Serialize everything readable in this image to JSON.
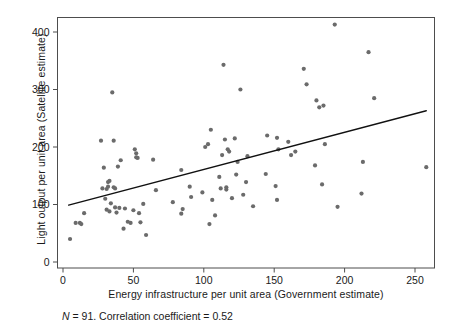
{
  "chart_data": {
    "type": "scatter",
    "title": "",
    "xlabel": "Energy infrastructure per unit area (Government estimate)",
    "ylabel": "Light output per unit area (Satellite estimate)",
    "caption_prefix": "N",
    "caption": " = 91. Correlation coefficient = 0.52",
    "n": 91,
    "correlation_coefficient": 0.52,
    "xlim": [
      -6,
      265
    ],
    "ylim": [
      -18,
      430
    ],
    "xticks": [
      0,
      50,
      100,
      150,
      200,
      250
    ],
    "yticks": [
      0,
      100,
      200,
      300,
      400
    ],
    "grid": false,
    "legend": "none",
    "marker_color": "#6b6b6b",
    "marker_size_px": 4.2,
    "line_color": "#111111",
    "axis_color": "#4d4d4d",
    "trendline": {
      "type": "linear-fit",
      "x_start": 4,
      "y_start": 99,
      "x_end": 258,
      "y_end": 263
    },
    "points": [
      [
        5,
        40
      ],
      [
        9,
        68
      ],
      [
        12,
        68
      ],
      [
        13,
        66
      ],
      [
        15,
        85
      ],
      [
        27,
        211
      ],
      [
        28,
        128
      ],
      [
        29,
        164
      ],
      [
        30,
        110
      ],
      [
        31,
        91
      ],
      [
        31,
        127
      ],
      [
        32,
        131
      ],
      [
        32,
        139
      ],
      [
        33,
        141
      ],
      [
        33,
        88
      ],
      [
        34,
        102
      ],
      [
        35,
        295
      ],
      [
        36,
        211
      ],
      [
        36,
        130
      ],
      [
        37,
        128
      ],
      [
        37,
        95
      ],
      [
        38,
        86
      ],
      [
        39,
        166
      ],
      [
        40,
        94
      ],
      [
        41,
        177
      ],
      [
        43,
        58
      ],
      [
        44,
        93
      ],
      [
        46,
        70
      ],
      [
        48,
        68
      ],
      [
        50,
        90
      ],
      [
        51,
        196
      ],
      [
        52,
        189
      ],
      [
        52,
        182
      ],
      [
        53,
        181
      ],
      [
        54,
        85
      ],
      [
        55,
        69
      ],
      [
        57,
        101
      ],
      [
        59,
        47
      ],
      [
        64,
        178
      ],
      [
        66,
        125
      ],
      [
        78,
        104
      ],
      [
        84,
        160
      ],
      [
        84,
        84
      ],
      [
        85,
        92
      ],
      [
        90,
        131
      ],
      [
        91,
        113
      ],
      [
        99,
        121
      ],
      [
        101,
        200
      ],
      [
        103,
        205
      ],
      [
        104,
        66
      ],
      [
        105,
        230
      ],
      [
        106,
        108
      ],
      [
        108,
        81
      ],
      [
        111,
        148
      ],
      [
        112,
        128
      ],
      [
        113,
        186
      ],
      [
        114,
        343
      ],
      [
        115,
        213
      ],
      [
        116,
        130
      ],
      [
        116,
        126
      ],
      [
        117,
        196
      ],
      [
        118,
        192
      ],
      [
        120,
        111
      ],
      [
        122,
        215
      ],
      [
        123,
        152
      ],
      [
        124,
        174
      ],
      [
        126,
        300
      ],
      [
        128,
        117
      ],
      [
        130,
        139
      ],
      [
        131,
        184
      ],
      [
        135,
        97
      ],
      [
        144,
        153
      ],
      [
        145,
        220
      ],
      [
        151,
        132
      ],
      [
        152,
        108
      ],
      [
        152,
        216
      ],
      [
        153,
        196
      ],
      [
        160,
        209
      ],
      [
        162,
        186
      ],
      [
        165,
        192
      ],
      [
        171,
        336
      ],
      [
        173,
        309
      ],
      [
        179,
        168
      ],
      [
        180,
        281
      ],
      [
        182,
        269
      ],
      [
        184,
        135
      ],
      [
        185,
        272
      ],
      [
        186,
        205
      ],
      [
        193,
        413
      ],
      [
        195,
        96
      ],
      [
        212,
        119
      ],
      [
        213,
        174
      ],
      [
        217,
        365
      ],
      [
        221,
        285
      ],
      [
        258,
        165
      ]
    ]
  }
}
